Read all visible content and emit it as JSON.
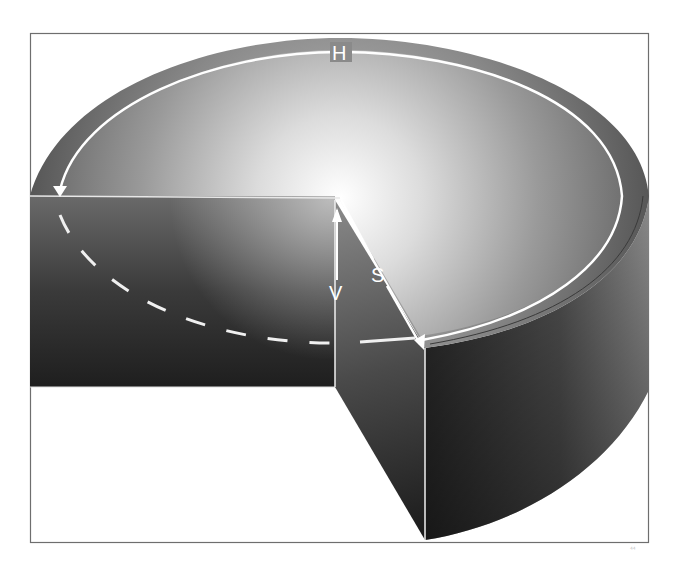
{
  "diagram": {
    "type": "3D cylinder cutaway with measurement annotations",
    "labels": {
      "h": "H",
      "v": "V",
      "s": "S"
    },
    "corner_mark": "⁴⁴",
    "colors": {
      "background": "#ffffff",
      "frame": "#6e6e6e",
      "highlight": "#ffffff",
      "dark_shade": "#1e1e1e",
      "mid_shade": "#6a6a6a",
      "annotation_line": "#ffffff"
    }
  }
}
